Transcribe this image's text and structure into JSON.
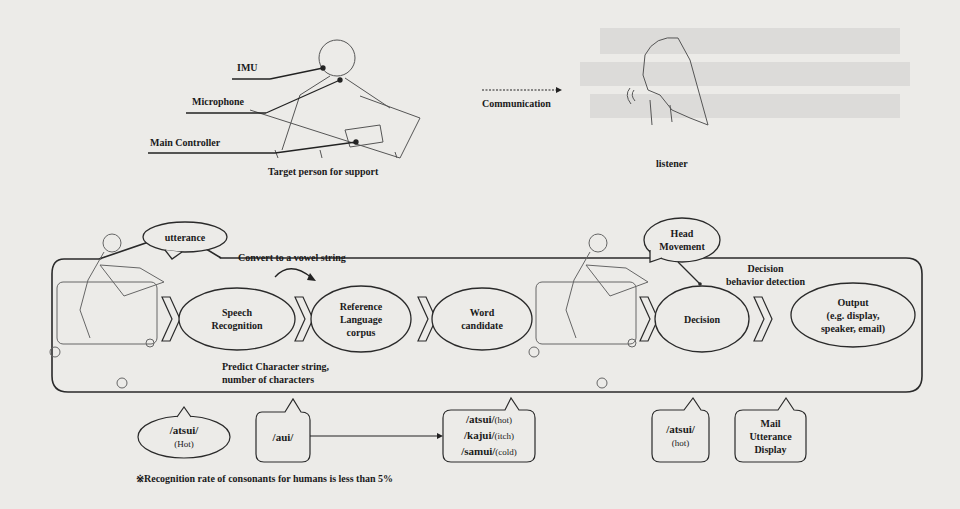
{
  "top": {
    "labels": {
      "imu": "IMU",
      "microphone": "Microphone",
      "main_controller": "Main Controller",
      "target_person": "Target person for support",
      "communication": "Communication",
      "listener": "listener"
    }
  },
  "panel": {
    "utterance_bubble": "utterance",
    "head_movement_bubble": [
      "Head",
      "Movement"
    ],
    "convert_note": "Convert to a vowel string",
    "predict_note": [
      "Predict Character string,",
      "number of characters"
    ],
    "decision_note": [
      "Decision",
      "behavior detection"
    ],
    "stages": [
      {
        "id": "speech-recognition",
        "lines": [
          "Speech",
          "Recognition"
        ]
      },
      {
        "id": "reference-corpus",
        "lines": [
          "Reference",
          "Language",
          "corpus"
        ]
      },
      {
        "id": "word-candidate",
        "lines": [
          "Word",
          "candidate"
        ]
      },
      {
        "id": "decision",
        "lines": [
          "Decision"
        ]
      },
      {
        "id": "output",
        "lines": [
          "Output",
          "(e.g. display,",
          "speaker, email)"
        ]
      }
    ]
  },
  "bottom": {
    "example_utterance": {
      "word": "/atsui/",
      "meaning": "(Hot)"
    },
    "vowel_string": "/aui/",
    "candidates": [
      {
        "word": "/atsui/",
        "meaning": "(hot)"
      },
      {
        "word": "/kajui/",
        "meaning": "(itch)"
      },
      {
        "word": "/samui/",
        "meaning": "(cold)"
      }
    ],
    "selected": {
      "word": "/atsui/",
      "meaning": "(hot)"
    },
    "output_modes": [
      "Mail",
      "Utterance",
      "Display"
    ],
    "footnote": "※Recognition rate of consonants for humans is less than 5%"
  }
}
